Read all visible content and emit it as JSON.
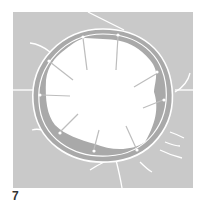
{
  "figure": {
    "label": "7",
    "colors": {
      "background_field": "#c9c9c9",
      "wall_band": "#a9a9a9",
      "lumen": "#ffffff",
      "lines": "#ffffff"
    }
  }
}
